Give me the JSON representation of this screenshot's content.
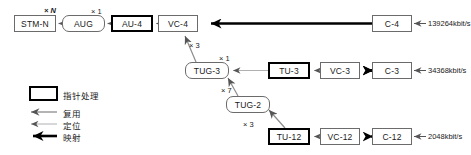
{
  "diagram": {
    "nodes": [
      {
        "id": "stm-n",
        "label": "STM-N",
        "shape": "rect",
        "x": 14,
        "y": 15,
        "w": 42,
        "h": 17
      },
      {
        "id": "aug",
        "label": "AUG",
        "shape": "round",
        "x": 62,
        "y": 15,
        "w": 43,
        "h": 17
      },
      {
        "id": "au-4",
        "label": "AU-4",
        "shape": "rect-bold",
        "x": 111,
        "y": 15,
        "w": 42,
        "h": 17
      },
      {
        "id": "vc-4",
        "label": "VC-4",
        "shape": "rect",
        "x": 158,
        "y": 15,
        "w": 40,
        "h": 17
      },
      {
        "id": "c-4",
        "label": "C-4",
        "shape": "rect",
        "x": 372,
        "y": 15,
        "w": 40,
        "h": 17
      },
      {
        "id": "tug-3",
        "label": "TUG-3",
        "shape": "round",
        "x": 185,
        "y": 62,
        "w": 44,
        "h": 17
      },
      {
        "id": "tu-3",
        "label": "TU-3",
        "shape": "rect-bold",
        "x": 268,
        "y": 62,
        "w": 42,
        "h": 17
      },
      {
        "id": "vc-3",
        "label": "VC-3",
        "shape": "rect",
        "x": 320,
        "y": 62,
        "w": 40,
        "h": 17
      },
      {
        "id": "c-3",
        "label": "C-3",
        "shape": "rect",
        "x": 372,
        "y": 62,
        "w": 40,
        "h": 17
      },
      {
        "id": "tug-2",
        "label": "TUG-2",
        "shape": "round",
        "x": 226,
        "y": 96,
        "w": 44,
        "h": 17
      },
      {
        "id": "tu-12",
        "label": "TU-12",
        "shape": "rect-bold",
        "x": 268,
        "y": 128,
        "w": 42,
        "h": 17
      },
      {
        "id": "vc-12",
        "label": "VC-12",
        "shape": "rect",
        "x": 320,
        "y": 128,
        "w": 40,
        "h": 17
      },
      {
        "id": "c-12",
        "label": "C-12",
        "shape": "rect",
        "x": 372,
        "y": 128,
        "w": 40,
        "h": 17
      }
    ],
    "multipliers": [
      {
        "id": "mult-n",
        "text": "× N",
        "x": 44,
        "y": 6,
        "italic": true
      },
      {
        "id": "mult-au4",
        "text": "× 1",
        "x": 91,
        "y": 7,
        "italic": false
      },
      {
        "id": "mult-vc4-3",
        "text": "× 3",
        "x": 189,
        "y": 41,
        "italic": false
      },
      {
        "id": "mult-tug3-1",
        "text": "× 1",
        "x": 219,
        "y": 54,
        "italic": false
      },
      {
        "id": "mult-tug3-7",
        "text": "× 7",
        "x": 221,
        "y": 86,
        "italic": false
      },
      {
        "id": "mult-tug2-3",
        "text": "× 3",
        "x": 243,
        "y": 120,
        "italic": false
      }
    ],
    "rates": [
      {
        "id": "rate-c4",
        "text": "139264kbit/s",
        "x": 428,
        "y": 19
      },
      {
        "id": "rate-c3",
        "text": "34368kbit/s",
        "x": 428,
        "y": 66
      },
      {
        "id": "rate-c12",
        "text": "2048kbit/s",
        "x": 428,
        "y": 132
      }
    ]
  },
  "legend": {
    "box_label": "指针处理",
    "items": [
      {
        "id": "legend-multiplex",
        "label": "复用",
        "kind": "multiplex"
      },
      {
        "id": "legend-align",
        "label": "定位",
        "kind": "align"
      },
      {
        "id": "legend-map",
        "label": "映射",
        "kind": "map"
      }
    ]
  },
  "colors": {
    "line_gray": "#8c8c8c",
    "line_light": "#b0b0b0",
    "line_black": "#000000",
    "box_border": "#6b6b6b",
    "box_border_bold": "#000000",
    "text": "#1a1a1a",
    "background": "#ffffff"
  }
}
